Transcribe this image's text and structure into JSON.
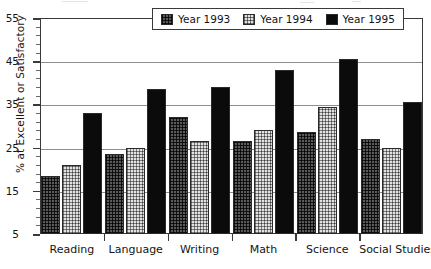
{
  "chart_data": {
    "type": "bar",
    "title": "",
    "xlabel": "",
    "ylabel": "% at Excellent or Satisfactory",
    "ylim": [
      5,
      55
    ],
    "ytick_labels": [
      "5",
      "15",
      "25",
      "35",
      "45",
      "55"
    ],
    "ytick_values": [
      5,
      15,
      25,
      35,
      45,
      55
    ],
    "minor_tick_step": 2,
    "grid": "horizontal",
    "legend_position": "top-center",
    "categories": [
      "Reading",
      "Language",
      "Writing",
      "Math",
      "Science",
      "Social Studies"
    ],
    "series": [
      {
        "name": "Year 1993",
        "values": [
          18.5,
          23.5,
          32,
          26.5,
          28.5,
          27
        ]
      },
      {
        "name": "Year 1994",
        "values": [
          21,
          25,
          26.5,
          29,
          34.5,
          25
        ]
      },
      {
        "name": "Year 1995",
        "values": [
          33,
          38.5,
          39,
          43,
          45.5,
          35.5
        ]
      }
    ]
  },
  "legend": {
    "items": [
      {
        "label": "Year 1993",
        "swatch": "dark-crosshatch-swatch"
      },
      {
        "label": "Year 1994",
        "swatch": "light-crosshatch-swatch"
      },
      {
        "label": "Year 1995",
        "swatch": "solid-black-swatch"
      }
    ]
  },
  "colors": {
    "series_1993": "#5a5a5a",
    "series_1994": "#e2e2e2",
    "series_1995": "#0b0b0b",
    "axis": "#3a3a3a",
    "gridline": "#8d8d8d",
    "background": "#ffffff"
  }
}
